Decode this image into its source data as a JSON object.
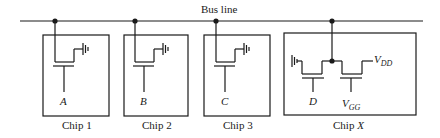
{
  "bus": {
    "label": "Bus line"
  },
  "chips": [
    {
      "name": "Chip 1",
      "input": "A"
    },
    {
      "name": "Chip 2",
      "input": "B"
    },
    {
      "name": "Chip 3",
      "input": "C"
    },
    {
      "name": "Chip X",
      "name_prefix": "Chip ",
      "name_var": "X",
      "input_d": "D",
      "vgg_main": "V",
      "vgg_sub": "GG",
      "vdd_main": "V",
      "vdd_sub": "DD"
    }
  ],
  "colors": {
    "line": "#1a1a1a",
    "background": "#ffffff"
  }
}
